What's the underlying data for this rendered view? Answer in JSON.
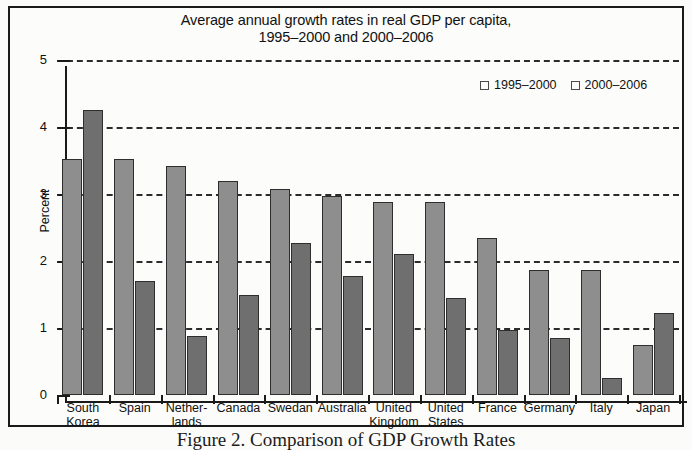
{
  "chart_data": {
    "type": "bar",
    "title": "Average annual growth rates in real GDP per capita, 1995–2000 and 2000–2006",
    "title_lines": [
      "Average annual growth rates in real GDP per capita,",
      "1995–2000 and 2000–2006"
    ],
    "xlabel": "",
    "ylabel": "Percent",
    "ylim": [
      0,
      5
    ],
    "yticks": [
      0,
      1,
      2,
      3,
      4,
      5
    ],
    "ytick_labels": [
      "0",
      "1",
      "2",
      "3",
      "4",
      "5"
    ],
    "grid": true,
    "grid_style": "dashed-horizontal",
    "legend_position": "top-right",
    "categories": [
      "South Korea",
      "Spain",
      "Netherlands",
      "Canada",
      "Swedan",
      "Australia",
      "United Kingdom",
      "United States",
      "France",
      "Germany",
      "Italy",
      "Japan"
    ],
    "category_label_lines": [
      [
        "South",
        "Korea"
      ],
      [
        "Spain"
      ],
      [
        "Nether-",
        "lands"
      ],
      [
        "Canada"
      ],
      [
        "Swedan"
      ],
      [
        "Australia"
      ],
      [
        "United",
        "Kingdom"
      ],
      [
        "United",
        "States"
      ],
      [
        "France"
      ],
      [
        "Germany"
      ],
      [
        "Italy"
      ],
      [
        "Japan"
      ]
    ],
    "series": [
      {
        "name": "1995–2000",
        "color": "#8e8e8e",
        "values": [
          3.52,
          3.52,
          3.42,
          3.2,
          3.08,
          2.97,
          2.88,
          2.88,
          2.35,
          1.87,
          1.87,
          0.75
        ]
      },
      {
        "name": "2000–2006",
        "color": "#6f6f6f",
        "values": [
          4.25,
          1.7,
          0.88,
          1.5,
          2.27,
          1.77,
          2.1,
          1.45,
          0.97,
          0.85,
          0.25,
          1.23
        ]
      }
    ]
  },
  "caption": {
    "text": "Figure 2. Comparison of GDP Growth Rates"
  }
}
